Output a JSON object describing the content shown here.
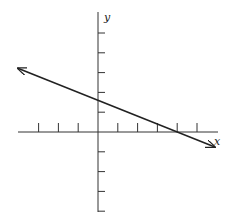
{
  "chart_data": {
    "type": "line",
    "title": "",
    "xlabel": "x",
    "ylabel": "y",
    "grid": false,
    "legend": null,
    "axis_ranges": {
      "x": [
        -4,
        6
      ],
      "y": [
        -5,
        5
      ]
    },
    "x_ticks": [
      -3,
      -2,
      -1,
      1,
      2,
      3,
      4,
      5
    ],
    "y_ticks": [
      -4,
      -3,
      -2,
      -1,
      1,
      2,
      3,
      4,
      5
    ],
    "tick_labels_shown": false,
    "series": [
      {
        "name": "line",
        "equation": "y = -0.4x + 1.6",
        "slope": -0.4,
        "y_intercept": 1.6,
        "x_intercept": 4,
        "x": [
          -4.05,
          5.9
        ],
        "y": [
          3.22,
          -0.76
        ],
        "arrows_both_ends": true,
        "color": "#222222"
      }
    ]
  },
  "labels": {
    "x_axis": "x",
    "y_axis": "y"
  },
  "colors": {
    "axes": "#333333",
    "line": "#222222",
    "background": "#ffffff"
  }
}
